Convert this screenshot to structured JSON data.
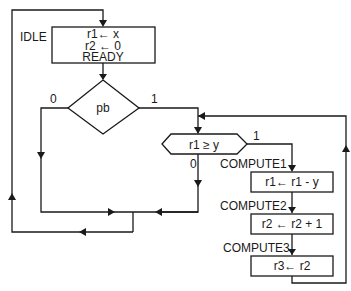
{
  "diagram": {
    "type": "ASM chart / flowchart",
    "states": [
      {
        "name": "IDLE",
        "lines": [
          "r1 ← x",
          "r2 ← 0",
          "READY"
        ]
      },
      {
        "name": "COMPUTE1",
        "lines": [
          "r1 ← r1 - y"
        ]
      },
      {
        "name": "COMPUTE2",
        "lines": [
          "r2 ← r2 + 1"
        ]
      },
      {
        "name": "COMPUTE3",
        "lines": [
          "r3 ← r2"
        ]
      }
    ],
    "decisions": [
      {
        "label": "pb",
        "branch_false": "0",
        "branch_true": "1"
      },
      {
        "label": "r1 ≥ y",
        "branch_false": "0",
        "branch_true": "1"
      }
    ]
  },
  "labels": {
    "idle": "IDLE",
    "idle_l1": "r1← x",
    "idle_l2": "r2 ← 0",
    "idle_l3": "READY",
    "pb": "pb",
    "pb_0": "0",
    "pb_1": "1",
    "cmp": "r1 ≥ y",
    "cmp_0": "0",
    "cmp_1": "1",
    "c1": "COMPUTE1",
    "c1_l": "r1← r1 - y",
    "c2": "COMPUTE2",
    "c2_l": "r2 ← r2 + 1",
    "c3": "COMPUTE3",
    "c3_l": "r3← r2"
  }
}
